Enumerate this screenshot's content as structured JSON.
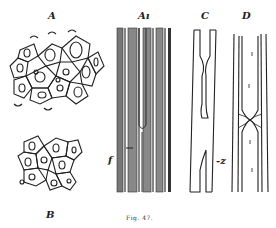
{
  "figure": {
    "caption": "Fig. 47.",
    "panels": {
      "A": {
        "label": "A",
        "description": "cross-section, thick-walled cells"
      },
      "A1": {
        "label": "Aı",
        "description": "longitudinal section, shaded fibers"
      },
      "B": {
        "label": "B",
        "description": "cross-section, smaller cells"
      },
      "C": {
        "label": "C",
        "description": "longitudinal cell, constricted"
      },
      "D": {
        "label": "D",
        "description": "longitudinal cells with junction"
      }
    },
    "annotations": {
      "f": "f",
      "z": "-z"
    },
    "colors": {
      "ink": "#222222",
      "shade": "#6a6a6a",
      "paper": "#ffffff"
    }
  }
}
